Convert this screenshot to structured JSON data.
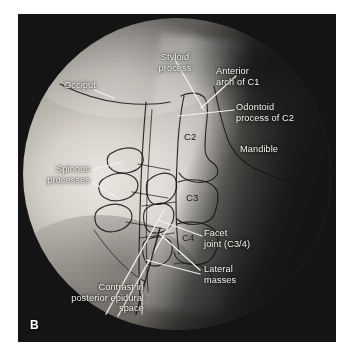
{
  "figure": {
    "panel_letter": "B",
    "modality": "fluoroscopic-radiograph",
    "view": "lateral cervical spine"
  },
  "annotations": [
    {
      "id": "styloid-process",
      "text": "Styloid\nprocess"
    },
    {
      "id": "anterior-arch-c1",
      "text": "Anterior\narch of C1"
    },
    {
      "id": "odontoid-process-c2",
      "text": "Odontoid\nprocess of C2"
    },
    {
      "id": "mandible",
      "text": "Mandible"
    },
    {
      "id": "occiput",
      "text": "Occiput"
    },
    {
      "id": "spinous-processes",
      "text": "Spinous\nprocesses"
    },
    {
      "id": "facet-joint-c3-4",
      "text": "Facet\njoint (C3/4)"
    },
    {
      "id": "lateral-masses",
      "text": "Lateral\nmasses"
    },
    {
      "id": "contrast-epidural",
      "text": "Contrast in\nposterior epidural\nspace"
    }
  ],
  "vertebral_labels": [
    {
      "id": "c2",
      "text": "C2"
    },
    {
      "id": "c3",
      "text": "C3"
    },
    {
      "id": "c4",
      "text": "C4"
    }
  ],
  "colors": {
    "label_text": "#f3f2ee",
    "leader_line": "#f2f1ec",
    "trace_ink": "#17140f",
    "plate_background": "#141414",
    "page_background": "#ffffff",
    "vertebral_label_text": "#14120e"
  }
}
